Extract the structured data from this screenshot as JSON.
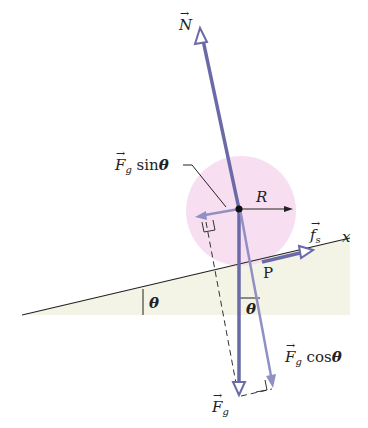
{
  "figure": {
    "type": "free-body diagram",
    "labels": {
      "normal_force": "N",
      "gravity_sin": {
        "vector": "F",
        "sub": "g",
        "func": "sin",
        "angle": "θ"
      },
      "gravity_cos": {
        "vector": "F",
        "sub": "g",
        "func": "cos",
        "angle": "θ"
      },
      "gravity": {
        "vector": "F",
        "sub": "g"
      },
      "radius": "R",
      "friction": {
        "vector": "f",
        "sub": "s"
      },
      "contact_point": "P",
      "axis": "x",
      "incline_angle": "θ",
      "force_angle": "θ"
    },
    "colors": {
      "force_arrow": "#6a6aa8",
      "component_arrow": "#9090c4",
      "ball_fill": "#f4d8ee",
      "incline_fill": "#f3f3e6",
      "line": "#222222"
    }
  }
}
